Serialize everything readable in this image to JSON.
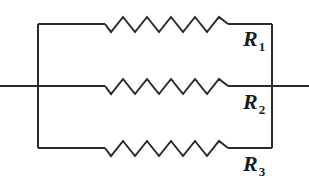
{
  "figure": {
    "name": "parallel-resistor-circuit",
    "stroke_color": "#2b2b2b",
    "background_color": "#ffffff",
    "label_color": "#1b1b1b"
  },
  "labels": {
    "r1": {
      "symbol": "R",
      "subscript": "1"
    },
    "r2": {
      "symbol": "R",
      "subscript": "2"
    },
    "r3": {
      "symbol": "R",
      "subscript": "3"
    }
  },
  "geometry": {
    "left_bus_x": 38,
    "right_bus_x": 272,
    "top_branch_y": 24,
    "mid_branch_y": 86,
    "bottom_branch_y": 148,
    "lead_left_x": 0,
    "lead_right_x": 309,
    "resistor_start_x": 105,
    "resistor_end_x": 228,
    "zigzag_amplitude": 7,
    "zigzag_peaks": 5
  },
  "paths": {
    "left_bus": "M 38,24 L 38,148",
    "right_bus": "M 272,24 L 272,148",
    "top_lead_in": "M 38,24 L 105,24",
    "top_lead_out": "M 228,24 L 272,24",
    "mid_lead_in": "M 0,86 L 105,86",
    "mid_lead_out": "M 228,86 L 309,86",
    "bottom_lead_in": "M 38,148 L 105,148",
    "bottom_lead_out": "M 228,148 L 272,148",
    "zigzag_top": "M 105,24 L 111,32 L 123,17 L 135,32 L 147,17 L 159,32 L 171,17 L 183,32 L 195,17 L 207,32 L 219,17 L 228,24",
    "zigzag_mid": "M 105,86 L 111,94 L 123,79 L 135,94 L 147,79 L 159,94 L 171,79 L 183,94 L 195,79 L 207,94 L 219,79 L 228,86",
    "zigzag_bottom": "M 105,148 L 111,156 L 123,141 L 135,156 L 147,141 L 159,156 L 171,141 L 183,156 L 195,141 L 207,156 L 219,141 L 228,148"
  }
}
